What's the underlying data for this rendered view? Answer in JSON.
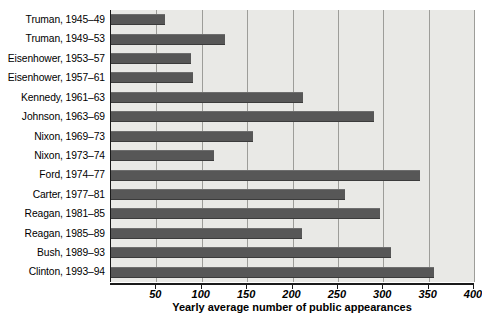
{
  "chart_data": {
    "type": "bar",
    "orientation": "horizontal",
    "title": "",
    "xlabel": "Yearly average number of public appearances",
    "ylabel": "",
    "xlim": [
      0,
      400
    ],
    "xticks": [
      50,
      100,
      150,
      200,
      250,
      300,
      350,
      400
    ],
    "xticklabels": [
      "50",
      "100",
      "150",
      "200",
      "250",
      "300",
      "350",
      "400"
    ],
    "grid": "vertical",
    "legend": "none",
    "bar_color": "#575757",
    "plot_background": "#e9e9e6",
    "categories": [
      "Truman, 1945–49",
      "Truman, 1949–53",
      "Eisenhower, 1953–57",
      "Eisenhower, 1957–61",
      "Kennedy, 1961–63",
      "Johnson, 1963–69",
      "Nixon, 1969–73",
      "Nixon, 1973–74",
      "Ford, 1974–77",
      "Carter, 1977–81",
      "Reagan, 1981–85",
      "Reagan, 1985–89",
      "Bush, 1989–93",
      "Clinton, 1993–94"
    ],
    "values": [
      60,
      126,
      88,
      90,
      212,
      290,
      157,
      113,
      341,
      258,
      296,
      210,
      308,
      356
    ]
  }
}
